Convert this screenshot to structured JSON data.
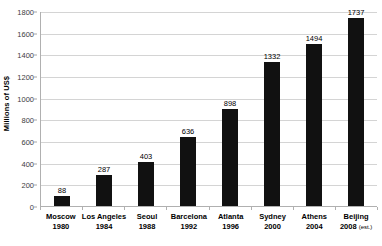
{
  "chart_data": {
    "type": "bar",
    "title": "",
    "subtitle": "",
    "xlabel": "",
    "ylabel": "Millions of US$",
    "ylim": [
      0,
      1800
    ],
    "ytick_step": 200,
    "yticks": [
      0,
      200,
      400,
      600,
      800,
      1000,
      1200,
      1400,
      1600,
      1800
    ],
    "ytick_labels": [
      "0",
      "200",
      "400",
      "600",
      "800",
      "1000",
      "1200",
      "1400",
      "1600",
      "1800"
    ],
    "grid": true,
    "grid_axis": "y",
    "legend": false,
    "legend_position": "none",
    "categories": [
      "Moscow 1980",
      "Los Angeles 1984",
      "Seoul 1988",
      "Barcelona 1992",
      "Atlanta 1996",
      "Sydney 2000",
      "Athens 2004",
      "Beijing 2008 (est.)"
    ],
    "category_lines": [
      {
        "city": "Moscow",
        "year": "1980",
        "note": ""
      },
      {
        "city": "Los Angeles",
        "year": "1984",
        "note": ""
      },
      {
        "city": "Seoul",
        "year": "1988",
        "note": ""
      },
      {
        "city": "Barcelona",
        "year": "1992",
        "note": ""
      },
      {
        "city": "Atlanta",
        "year": "1996",
        "note": ""
      },
      {
        "city": "Sydney",
        "year": "2000",
        "note": ""
      },
      {
        "city": "Athens",
        "year": "2004",
        "note": ""
      },
      {
        "city": "Beijing",
        "year": "2008",
        "note": "(est.)"
      }
    ],
    "values": [
      88,
      287,
      403,
      636,
      898,
      1332,
      1494,
      1737
    ],
    "value_labels": [
      "88",
      "287",
      "403",
      "636",
      "898",
      "1332",
      "1494",
      "1737"
    ],
    "show_value_labels": true,
    "bar_color": "#111111",
    "gridline_color": "#d4d4d4",
    "axis_color": "#b0b0b0",
    "background_color": "#ffffff"
  }
}
